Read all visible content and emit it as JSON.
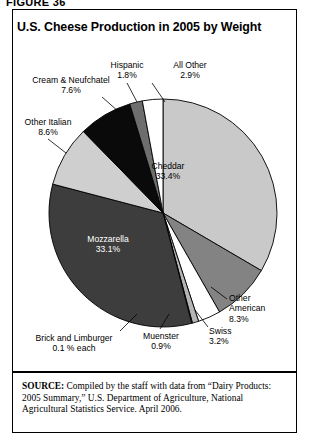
{
  "figure": {
    "label": "FIGURE 36"
  },
  "chart_title": "U.S. Cheese Production in 2005 by Weight",
  "source": {
    "keyword": "SOURCE:",
    "text": " Compiled by the staff with data from “Dairy Products: 2005 Summary,” U.S. Department of Agriculture, National Agricultural Statistics Service. April 2006."
  },
  "labels": {
    "cheddar_name": "Cheddar",
    "cheddar_pct": "33.4%",
    "other_american_name_1": "Other",
    "other_american_name_2": "American",
    "other_american_pct": "8.3%",
    "swiss_name": "Swiss",
    "swiss_pct": "3.2%",
    "muenster_name": "Muenster",
    "muenster_pct": "0.9%",
    "brick_name": "Brick and Limburger",
    "brick_pct": "0.1 % each",
    "mozzarella_name": "Mozzarella",
    "mozzarella_pct": "33.1%",
    "other_italian_name": "Other Italian",
    "other_italian_pct": "8.6%",
    "cream_name": "Cream & Neufchatel",
    "cream_pct": "7.6%",
    "hispanic_name": "Hispanic",
    "hispanic_pct": "1.8%",
    "all_other_name": "All Other",
    "all_other_pct": "2.9%"
  },
  "chart_data": {
    "type": "pie",
    "title": "U.S. Cheese Production in 2005 by Weight",
    "xlabel": "",
    "ylabel": "",
    "legend": "none (direct slice labels with leader lines)",
    "units": "percent of total weight",
    "start_angle_deg": 0,
    "direction": "clockwise",
    "categories": [
      "Cheddar",
      "Other American",
      "Swiss",
      "Muenster",
      "Brick and Limburger",
      "Mozzarella",
      "Other Italian",
      "Cream & Neufchatel",
      "Hispanic",
      "All Other"
    ],
    "values": [
      33.4,
      8.3,
      3.2,
      0.9,
      0.1,
      33.1,
      8.6,
      7.6,
      1.8,
      2.9
    ],
    "slices": [
      {
        "name": "Cheddar",
        "value": 33.4,
        "label": "33.4%",
        "color": "#c9c9c9",
        "text_color": "#000000"
      },
      {
        "name": "Other American",
        "value": 8.3,
        "label": "8.3%",
        "color": "#838383",
        "text_color": "#000000"
      },
      {
        "name": "Swiss",
        "value": 3.2,
        "label": "3.2%",
        "color": "#ffffff",
        "text_color": "#000000"
      },
      {
        "name": "Muenster",
        "value": 0.9,
        "label": "0.9%",
        "color": "#b5b5b5",
        "text_color": "#000000"
      },
      {
        "name": "Brick and Limburger",
        "value": 0.1,
        "label": "0.1 % each",
        "color": "#ffffff",
        "text_color": "#000000"
      },
      {
        "name": "Mozzarella",
        "value": 33.1,
        "label": "33.1%",
        "color": "#3d3d3d",
        "text_color": "#ffffff"
      },
      {
        "name": "Other Italian",
        "value": 8.6,
        "label": "8.6%",
        "color": "#cfcfcf",
        "text_color": "#000000"
      },
      {
        "name": "Cream & Neufchatel",
        "value": 7.6,
        "label": "7.6%",
        "color": "#0a0a0a",
        "text_color": "#ffffff"
      },
      {
        "name": "Hispanic",
        "value": 1.8,
        "label": "1.8%",
        "color": "#6e6e6e",
        "text_color": "#000000"
      },
      {
        "name": "All Other",
        "value": 2.9,
        "label": "2.9%",
        "color": "#ffffff",
        "text_color": "#000000"
      }
    ],
    "total": 100.0
  },
  "colors": {
    "outline": "#000000",
    "background": "#ffffff"
  }
}
